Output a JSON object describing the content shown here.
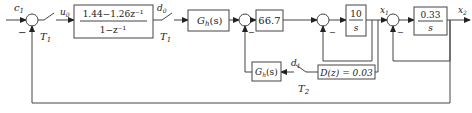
{
  "diagram": {
    "type": "control-block-diagram",
    "signals": {
      "input": "c",
      "input_sub": "1",
      "u0": "u",
      "u0_sub": "0",
      "d0": "d",
      "d0_sub": "0",
      "d1": "d",
      "d1_sub": "1",
      "x1": "x",
      "x1_sub": "1",
      "x2": "x",
      "x2_sub": "2"
    },
    "switches": {
      "s1_label": "T",
      "s1_sub": "1",
      "s2_label": "T",
      "s2_sub": "1",
      "s3_label": "T",
      "s3_sub": "2"
    },
    "blocks": {
      "controller_num": "1.44−1.26z⁻¹",
      "controller_den": "1−z⁻¹",
      "hold1": "G",
      "hold1_sub": "h",
      "hold1_arg": "(s)",
      "gain": "66.7",
      "integrator1_num": "10",
      "integrator1_den": "s",
      "integrator2_num": "0.33",
      "integrator2_den": "s",
      "hold2": "G",
      "hold2_sub": "h",
      "hold2_arg": "(s)",
      "inner_controller": "D(z) = 0.03"
    },
    "sum_signs": {
      "minus": "−"
    }
  }
}
